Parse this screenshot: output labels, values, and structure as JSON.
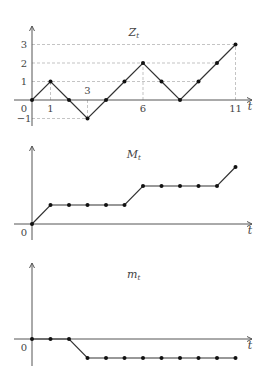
{
  "chart_data": [
    {
      "type": "line",
      "title": "Z_t",
      "title_main": "Z",
      "title_sub": "t",
      "xlabel": "t",
      "x": [
        0,
        1,
        2,
        3,
        4,
        5,
        6,
        7,
        8,
        9,
        10,
        11
      ],
      "values": [
        0,
        1,
        0,
        -1,
        0,
        1,
        2,
        1,
        0,
        1,
        2,
        3
      ],
      "xticks": [
        "0",
        "1",
        "3",
        "6",
        "11"
      ],
      "yticks": [
        "-1",
        "1",
        "2",
        "3"
      ],
      "ylim": [
        -1,
        3
      ],
      "grid": "dashed guide lines at labeled points"
    },
    {
      "type": "line",
      "title": "M_t",
      "title_main": "M",
      "title_sub": "t",
      "xlabel": "t",
      "x": [
        0,
        1,
        2,
        3,
        4,
        5,
        6,
        7,
        8,
        9,
        10,
        11
      ],
      "values": [
        0,
        1,
        1,
        1,
        1,
        1,
        2,
        2,
        2,
        2,
        2,
        3
      ],
      "origin_label": "0"
    },
    {
      "type": "line",
      "title": "m_t",
      "title_main": "m",
      "title_sub": "t",
      "xlabel": "t",
      "x": [
        0,
        1,
        2,
        3,
        4,
        5,
        6,
        7,
        8,
        9,
        10,
        11
      ],
      "values": [
        0,
        0,
        0,
        -1,
        -1,
        -1,
        -1,
        -1,
        -1,
        -1,
        -1,
        -1
      ],
      "origin_label": "0"
    }
  ]
}
